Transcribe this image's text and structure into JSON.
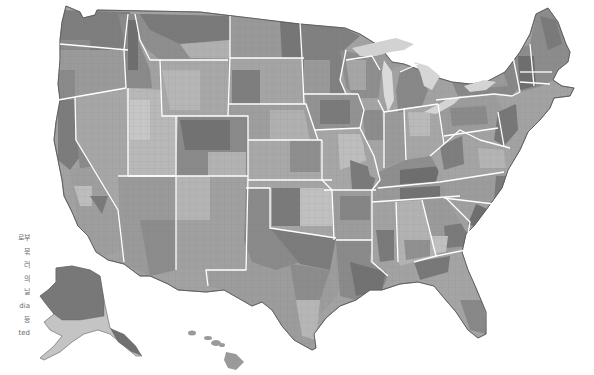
{
  "map": {
    "title": "United States county map",
    "style": "grayscale choropleth",
    "colors": {
      "background": "#ffffff",
      "state_border": "#ffffff",
      "county_border": "#707070",
      "lake": "#d4d4d4",
      "shade_light": "#c6c6c6",
      "shade_mid_light": "#aeaeae",
      "shade_mid": "#9a9a9a",
      "shade_mid_dark": "#858585",
      "shade_dark": "#6e6e6e"
    },
    "regions": [
      "Contiguous United States",
      "Alaska",
      "Hawaii"
    ]
  },
  "caption": {
    "lines": [
      "로부",
      "묶",
      "러",
      "의",
      "닐",
      "dia",
      "등",
      "ted"
    ]
  }
}
